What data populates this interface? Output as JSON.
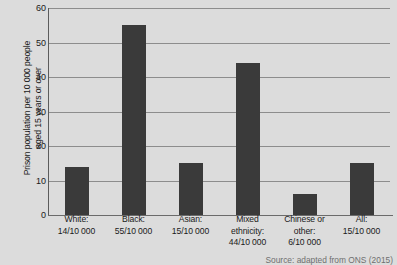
{
  "chart_data": {
    "type": "bar",
    "title": "",
    "xlabel": "",
    "ylabel": "Prison population per 10 000 people aged 15 years or over",
    "ylabel_lines": [
      "Prison population per 10 000 people",
      "aged 15 years or over"
    ],
    "categories": [
      "White:",
      "Black:",
      "Asian:",
      "Mixed ethnicity:",
      "Chinese or other:",
      "All:"
    ],
    "category_label_lines": [
      [
        "White:",
        "14/10 000"
      ],
      [
        "Black:",
        "55/10 000"
      ],
      [
        "Asian:",
        "15/10 000"
      ],
      [
        "Mixed",
        "ethnicity:",
        "44/10 000"
      ],
      [
        "Chinese or",
        "other:",
        "6/10 000"
      ],
      [
        "All:",
        "15/10 000"
      ]
    ],
    "values": [
      14,
      55,
      15,
      44,
      6,
      15
    ],
    "value_labels": [
      "14/10 000",
      "55/10 000",
      "15/10 000",
      "44/10 000",
      "6/10 000",
      "15/10 000"
    ],
    "ylim": [
      0,
      60
    ],
    "y_ticks": [
      0,
      10,
      20,
      30,
      40,
      50,
      60
    ],
    "y_tick_labels": [
      "0",
      "10",
      "20",
      "30",
      "40",
      "50",
      "60"
    ],
    "grid": "horizontal",
    "legend": "none",
    "bar_color": "#3a3a3a",
    "gridline_color": "#8d8d8d",
    "plot_background": "#dcdcdc",
    "source": "Source: adapted from ONS (2015)"
  }
}
